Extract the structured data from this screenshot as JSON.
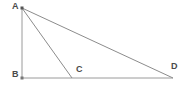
{
  "figure": {
    "background_color": "#ffffff",
    "stroke_color": "#8c8c8c",
    "label_color": "#4a4a4a",
    "vertex_dot_color": "#555555",
    "canvas": {
      "width": 190,
      "height": 92
    },
    "labels": {
      "a": "A",
      "b": "B",
      "c": "C",
      "d": "D"
    },
    "points": {
      "a": {
        "x": 22,
        "y": 8
      },
      "b": {
        "x": 22,
        "y": 78
      },
      "c": {
        "x": 72,
        "y": 78
      },
      "d": {
        "x": 173,
        "y": 78
      }
    },
    "segments": [
      {
        "name": "AB",
        "from": "a",
        "to": "b"
      },
      {
        "name": "BD",
        "from": "b",
        "to": "d"
      },
      {
        "name": "AC",
        "from": "a",
        "to": "c"
      },
      {
        "name": "AD",
        "from": "a",
        "to": "d"
      }
    ]
  }
}
